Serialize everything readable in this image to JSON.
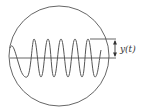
{
  "diagram": {
    "amplitude_label": "y(t)",
    "colors": {
      "stroke": "#555555",
      "background": "#ffffff",
      "label": "#333333"
    },
    "elements": [
      "circle",
      "sine-wave",
      "horizontal-axis",
      "amplitude-reference-line",
      "double-arrow",
      "amplitude-label"
    ]
  }
}
